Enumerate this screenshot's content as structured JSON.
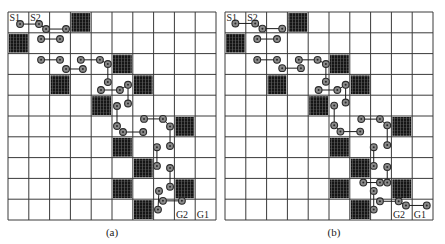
{
  "figure": {
    "grid": {
      "rows": 10,
      "cols": 10,
      "cell_px": 20.8
    },
    "colors": {
      "grid_line": "#3a3a3a",
      "obstacle": "#151515",
      "obstacle_hatch": "#6a6a6a",
      "node_fill": "#8a8a8a",
      "node_stroke": "#2a2a2a",
      "edge": "#1a1a1a",
      "background": "#ffffff"
    },
    "panels": [
      {
        "id": "a",
        "caption": "(a)",
        "origin": [
          8,
          12
        ],
        "caption_x": 92,
        "labels": [
          {
            "text": "S1",
            "col": 0,
            "row": 0,
            "pos": "tl"
          },
          {
            "text": "S2",
            "col": 1,
            "row": 0,
            "pos": "tl"
          },
          {
            "text": "G2",
            "col": 8,
            "row": 9,
            "pos": "bl"
          },
          {
            "text": "G1",
            "col": 9,
            "row": 9,
            "pos": "bl"
          }
        ],
        "obstacles": [
          [
            3,
            0
          ],
          [
            0,
            1
          ],
          [
            5,
            2
          ],
          [
            2,
            3
          ],
          [
            6,
            3
          ],
          [
            4,
            4
          ],
          [
            8,
            5
          ],
          [
            5,
            6
          ],
          [
            6,
            7
          ],
          [
            5,
            8
          ],
          [
            8,
            8
          ],
          [
            6,
            9
          ]
        ],
        "paths": [
          [
            [
              0.58,
              0.58
            ],
            [
              1.49,
              0.58
            ],
            [
              1.83,
              0.82
            ],
            [
              2.79,
              0.82
            ]
          ],
          [
            [
              1.59,
              1.3
            ],
            [
              2.5,
              1.3
            ]
          ],
          [
            [
              1.59,
              2.3
            ],
            [
              2.5,
              2.3
            ]
          ],
          [
            [
              2.79,
              2.74
            ],
            [
              3.6,
              2.74
            ]
          ],
          [
            [
              3.5,
              2.3
            ],
            [
              4.42,
              2.3
            ],
            [
              4.8,
              2.5
            ],
            [
              4.8,
              3.37
            ]
          ],
          [
            [
              4.47,
              3.75
            ],
            [
              5.38,
              3.75
            ],
            [
              5.77,
              3.5
            ],
            [
              5.77,
              4.4
            ]
          ],
          [
            [
              5.24,
              4.52
            ],
            [
              5.24,
              5.48
            ],
            [
              5.53,
              5.77
            ],
            [
              6.5,
              5.77
            ]
          ],
          [
            [
              6.54,
              5.14
            ],
            [
              7.45,
              5.14
            ],
            [
              7.79,
              5.5
            ],
            [
              7.79,
              6.44
            ]
          ],
          [
            [
              7.16,
              6.5
            ],
            [
              7.16,
              7.4
            ]
          ],
          [
            [
              7.79,
              7.5
            ],
            [
              7.79,
              8.4
            ]
          ],
          [
            [
              7.26,
              8.6
            ],
            [
              7.21,
              9.5
            ]
          ],
          [
            [
              7.45,
              9.08
            ],
            [
              8.36,
              9.08
            ]
          ]
        ]
      },
      {
        "id": "b",
        "caption": "(b)",
        "origin": [
          225,
          12
        ],
        "caption_x": 314,
        "labels": [
          {
            "text": "S1",
            "col": 0,
            "row": 0,
            "pos": "tl"
          },
          {
            "text": "S2",
            "col": 1,
            "row": 0,
            "pos": "tl"
          },
          {
            "text": "G2",
            "col": 8,
            "row": 9,
            "pos": "bl"
          },
          {
            "text": "G1",
            "col": 9,
            "row": 9,
            "pos": "bl"
          }
        ],
        "obstacles": [
          [
            3,
            0
          ],
          [
            0,
            1
          ],
          [
            5,
            2
          ],
          [
            2,
            3
          ],
          [
            6,
            3
          ],
          [
            4,
            4
          ],
          [
            8,
            5
          ],
          [
            5,
            6
          ],
          [
            6,
            7
          ],
          [
            5,
            8
          ],
          [
            8,
            8
          ],
          [
            6,
            9
          ]
        ],
        "paths": [
          [
            [
              0.5,
              0.55
            ],
            [
              1.45,
              0.55
            ],
            [
              1.8,
              0.8
            ],
            [
              2.75,
              0.8
            ]
          ],
          [
            [
              1.55,
              1.3
            ],
            [
              2.5,
              1.3
            ]
          ],
          [
            [
              1.55,
              2.3
            ],
            [
              2.5,
              2.3
            ]
          ],
          [
            [
              2.75,
              2.7
            ],
            [
              3.65,
              2.7
            ]
          ],
          [
            [
              3.55,
              2.3
            ],
            [
              4.45,
              2.3
            ],
            [
              4.85,
              2.5
            ],
            [
              4.85,
              3.35
            ]
          ],
          [
            [
              4.5,
              3.75
            ],
            [
              5.4,
              3.75
            ],
            [
              5.8,
              3.5
            ],
            [
              5.8,
              4.35
            ]
          ],
          [
            [
              5.25,
              4.5
            ],
            [
              5.25,
              5.45
            ],
            [
              5.55,
              5.75
            ],
            [
              6.5,
              5.75
            ]
          ],
          [
            [
              6.55,
              5.15
            ],
            [
              7.45,
              5.15
            ],
            [
              7.8,
              5.45
            ],
            [
              7.8,
              6.4
            ]
          ],
          [
            [
              7.15,
              6.5
            ],
            [
              7.15,
              7.4
            ]
          ],
          [
            [
              7.8,
              7.45
            ],
            [
              7.8,
              8.2
            ]
          ],
          [
            [
              6.65,
              8.2
            ],
            [
              7.45,
              8.2
            ]
          ],
          [
            [
              7.15,
              8.6
            ],
            [
              7.15,
              9.5
            ]
          ],
          [
            [
              7.45,
              9.1
            ],
            [
              8.35,
              9.1
            ],
            [
              8.7,
              9.3
            ],
            [
              9.7,
              9.3
            ]
          ]
        ]
      }
    ]
  }
}
